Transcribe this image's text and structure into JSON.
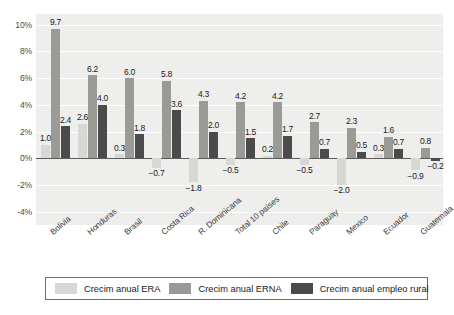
{
  "chart_data": {
    "type": "bar",
    "title": "",
    "subtitle": "",
    "xlabel": "",
    "ylabel": "",
    "ylim": [
      -5,
      10.8
    ],
    "yticks": [
      "-4%",
      "-2%",
      "0%",
      "2%",
      "4%",
      "6%",
      "8%",
      "10%"
    ],
    "ytick_values": [
      -4,
      -2,
      0,
      2,
      4,
      6,
      8,
      10
    ],
    "grid": true,
    "legend_position": "bottom",
    "categories": [
      "Bolivia",
      "Honduras",
      "Brasil",
      "Costa Rica",
      "R. Dominicana",
      "Total 10 países",
      "Chile",
      "Paraguay",
      "Mexico",
      "Ecuador",
      "Guatemala"
    ],
    "series": [
      {
        "name": "Crecim anual ERA",
        "color": "#d7d7d3",
        "values": [
          1.0,
          2.6,
          0.3,
          -0.7,
          -1.8,
          -0.5,
          0.2,
          -0.5,
          -2.0,
          0.3,
          -0.9
        ],
        "labels": [
          "1.0",
          "2.6",
          "0.3",
          "-0.7",
          "-1.8",
          "-0.5",
          "0.2",
          "-0.5",
          "-2.0",
          "0.3",
          "-0.9"
        ]
      },
      {
        "name": "Crecim anual ERNA",
        "color": "#9a9a96",
        "values": [
          9.7,
          6.2,
          6.0,
          5.8,
          4.3,
          4.2,
          4.2,
          2.7,
          2.3,
          1.6,
          0.8
        ],
        "labels": [
          "9.7",
          "6.2",
          "6.0",
          "5.8",
          "4.3",
          "4.2",
          "4.2",
          "2.7",
          "2.3",
          "1.6",
          "0.8"
        ]
      },
      {
        "name": "Crecim anual empleo rural",
        "color": "#4b4b4b",
        "values": [
          2.4,
          4.0,
          1.8,
          3.6,
          2.0,
          1.5,
          1.7,
          0.7,
          0.5,
          0.7,
          -0.2
        ],
        "labels": [
          "2.4",
          "4.0",
          "1.8",
          "3.6",
          "2.0",
          "1.5",
          "1.7",
          "0.7",
          "0.5",
          "0.7",
          "-0.2"
        ]
      }
    ]
  },
  "legend": {
    "items": [
      {
        "label": "Crecim anual ERA",
        "swatch": "era"
      },
      {
        "label": "Crecim anual ERNA",
        "swatch": "erna"
      },
      {
        "label": "Crecim anual empleo rural",
        "swatch": "rural"
      }
    ]
  }
}
